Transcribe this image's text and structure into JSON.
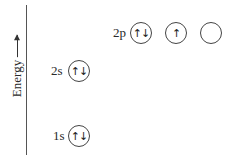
{
  "axis": {
    "label": "Energy",
    "direction": "up"
  },
  "levels": [
    {
      "name": "1s",
      "orbitals": [
        "↑↓"
      ]
    },
    {
      "name": "2s",
      "orbitals": [
        "↑↓"
      ]
    },
    {
      "name": "2p",
      "orbitals": [
        "↑↓",
        "↑",
        ""
      ]
    }
  ]
}
